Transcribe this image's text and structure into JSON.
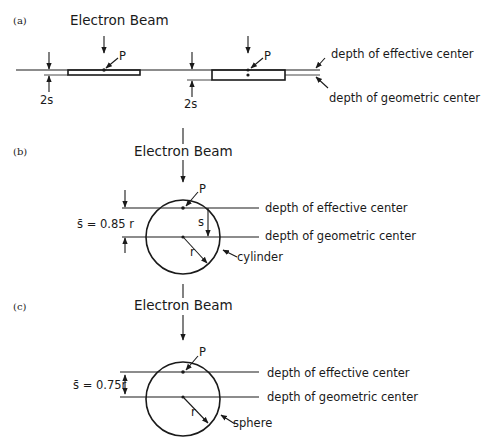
{
  "figure": {
    "panels": [
      {
        "id": "a",
        "label": "(a)",
        "beam_label": "Electron Beam",
        "point_label": "P",
        "thickness_label_left": "2s",
        "thickness_label_right": "2s",
        "effective_center_label": "depth of effective center",
        "geometric_center_label": "depth of geometric center",
        "shape": "slab"
      },
      {
        "id": "b",
        "label": "(b)",
        "beam_label": "Electron Beam",
        "point_label": "P",
        "s_bar_label": "s̄ = 0.85 r",
        "s_label": "s",
        "r_label": "r",
        "shape_label": "cylinder",
        "effective_center_label": "depth of effective center",
        "geometric_center_label": "depth of geometric center"
      },
      {
        "id": "c",
        "label": "(c)",
        "beam_label": "Electron Beam",
        "point_label": "P",
        "s_bar_label": "s̄ = 0.75r",
        "r_label": "r",
        "shape_label": "sphere",
        "effective_center_label": "depth of effective center",
        "geometric_center_label": "depth of geometric center"
      }
    ]
  }
}
